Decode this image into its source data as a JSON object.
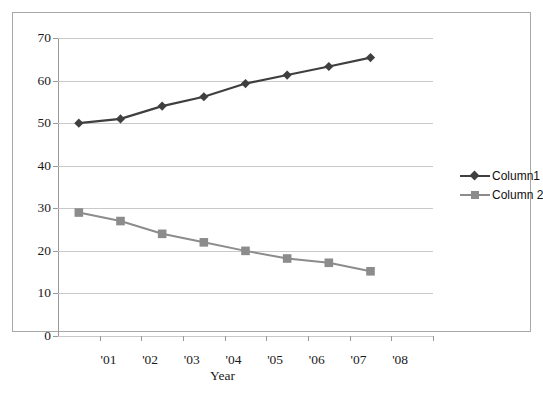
{
  "chart_data": {
    "type": "line",
    "title": "",
    "xlabel": "Year",
    "ylabel": "",
    "categories": [
      "'01",
      "'02",
      "'03",
      "'04",
      "'05",
      "'06",
      "'07",
      "'08"
    ],
    "x_tick_labels": [
      "'01",
      "'02",
      "'03",
      "'04",
      "'05",
      "'06",
      "'07",
      "'08"
    ],
    "y_tick_labels": [
      "0",
      "10",
      "20",
      "30",
      "40",
      "50",
      "60",
      "70"
    ],
    "y_ticks": [
      0,
      10,
      20,
      30,
      40,
      50,
      60,
      70
    ],
    "ylim": [
      0,
      70
    ],
    "grid": "horizontal",
    "legend_position": "right",
    "series": [
      {
        "name": "Column1",
        "marker": "diamond",
        "color": "#3f3f3f",
        "values": [
          50.0,
          51.0,
          54.0,
          56.2,
          59.3,
          61.3,
          63.3,
          65.4
        ]
      },
      {
        "name": "Column 2",
        "marker": "square",
        "color": "#8c8c8c",
        "values": [
          29.0,
          27.0,
          24.0,
          22.0,
          20.0,
          18.2,
          17.2,
          15.2
        ]
      }
    ]
  },
  "colors": {
    "series1": "#3f3f3f",
    "series2": "#8c8c8c",
    "gridline": "#c9c9c9",
    "axis": "#9a9a9a",
    "frame_border": "#a8a8a8",
    "background": "#ffffff"
  }
}
